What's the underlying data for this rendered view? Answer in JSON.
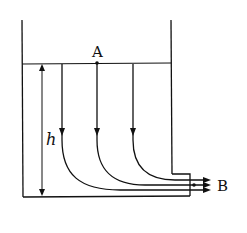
{
  "diagram": {
    "type": "fluid-flow-container",
    "labels": {
      "point_a": "A",
      "point_b": "B",
      "height": "h"
    },
    "elements": {
      "container": "open tank with outlet step at bottom-right",
      "water_surface": "free surface line",
      "streamlines": 3,
      "outflow_arrows": 3
    },
    "colors": {
      "stroke": "#111111",
      "background": "#ffffff"
    }
  }
}
